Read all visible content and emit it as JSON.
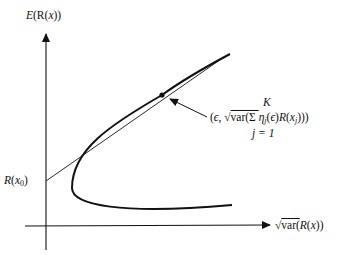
{
  "diagram": {
    "y_axis_label": {
      "prefix": "E",
      "text": "(R(",
      "var": "x",
      "suffix": "))"
    },
    "x_axis_label": {
      "root": "√",
      "text": "var(",
      "var": "R",
      "open": "(",
      "x": "x",
      "close": "))"
    },
    "intercept_label": {
      "var": "R",
      "open": "(",
      "x": "x",
      "sub": "0",
      "close": ")"
    },
    "point_label": "K",
    "point_formula": {
      "open": "(",
      "eps": "ϵ",
      "sep": ", ",
      "root": "√",
      "var": "var(Σ ",
      "eta": "η",
      "eta_sub": "j",
      "eps2_open": "(",
      "eps2": "ϵ",
      "eps2_close": ")",
      "R": "R",
      "R_open": "(",
      "x": "x",
      "x_sub": "j",
      "close": ")))"
    },
    "index_label": "j = 1",
    "colors": {
      "ink": "#111111",
      "background": "#ffffff"
    }
  }
}
